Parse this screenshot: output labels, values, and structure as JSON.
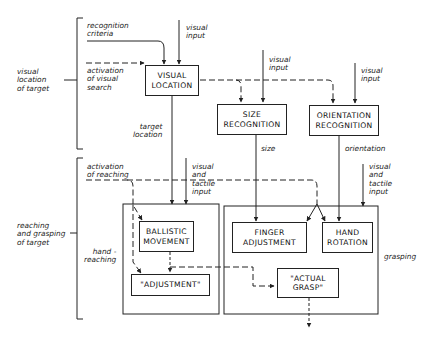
{
  "groups": {
    "visual_location": "visual\nlocation\nof target",
    "reaching_grasping": "reaching\nand grasping\nof target",
    "hand_reaching": "hand -\nreaching",
    "grasping": "grasping"
  },
  "boxes": {
    "visual_location": "VISUAL\nLOCATION",
    "size_recognition": "SIZE\nRECOGNITION",
    "orientation_recognition": "ORIENTATION\nRECOGNITION",
    "ballistic_movement": "BALLISTIC\nMOVEMENT",
    "adjustment": "\"ADJUSTMENT\"",
    "finger_adjustment": "FINGER\nADJUSTMENT",
    "hand_rotation": "HAND\nROTATION",
    "actual_grasp": "\"ACTUAL\nGRASP\""
  },
  "labels": {
    "recognition_criteria": "recognition\ncriteria",
    "visual_input_1": "visual\ninput",
    "activation_visual_search": "activation\nof visual\nsearch",
    "visual_input_2": "visual\ninput",
    "visual_input_3": "visual\ninput",
    "target_location": "target\nlocation",
    "size": "size",
    "orientation": "orientation",
    "activation_reaching": "activation\nof reaching",
    "visual_tactile_1": "visual\nand\ntactile\ninput",
    "visual_tactile_2": "visual\nand\ntactile\ninput"
  }
}
